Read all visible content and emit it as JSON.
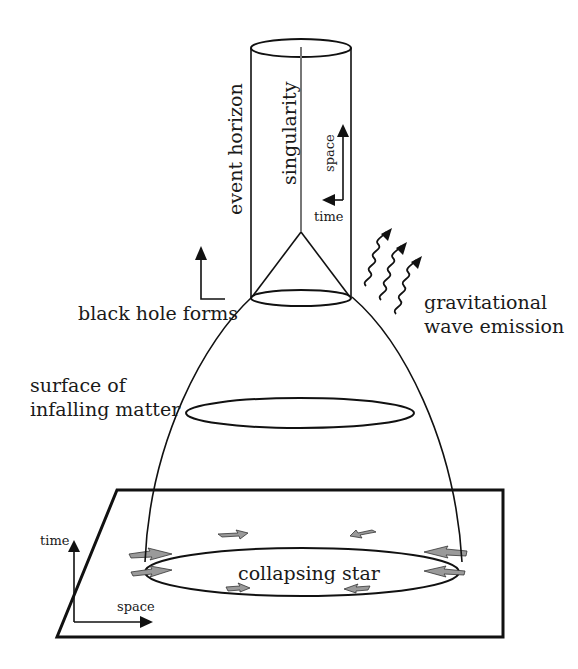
{
  "diagram": {
    "type": "spacetime-diagram",
    "colors": {
      "line": "#111111",
      "singularity": "#777777",
      "arrow_fill": "#9a9a9a",
      "background": "#ffffff"
    },
    "labels": {
      "event_horizon": "event horizon",
      "singularity": "singularity",
      "inner_axis_space": "space",
      "inner_axis_time": "time",
      "black_hole_forms": "black hole forms",
      "gravitational_wave_line1": "gravitational",
      "gravitational_wave_line2": "wave emission",
      "surface_line1": "surface of",
      "surface_line2": "infalling matter",
      "collapsing_star": "collapsing star",
      "base_axis_time": "time",
      "base_axis_space": "space"
    },
    "elements": [
      {
        "id": "event-horizon-cylinder",
        "shape": "cylinder"
      },
      {
        "id": "singularity-line",
        "shape": "line"
      },
      {
        "id": "trapped-cone",
        "shape": "cone"
      },
      {
        "id": "horizon-formation-ring",
        "shape": "ellipse"
      },
      {
        "id": "infalling-surface-ring",
        "shape": "ellipse"
      },
      {
        "id": "collapsing-star-ring",
        "shape": "ellipse",
        "inward_arrows": 8
      },
      {
        "id": "gravitational-waves",
        "shape": "wavy-arrows",
        "count": 3
      },
      {
        "id": "spacelike-plane",
        "shape": "parallelogram"
      }
    ]
  }
}
